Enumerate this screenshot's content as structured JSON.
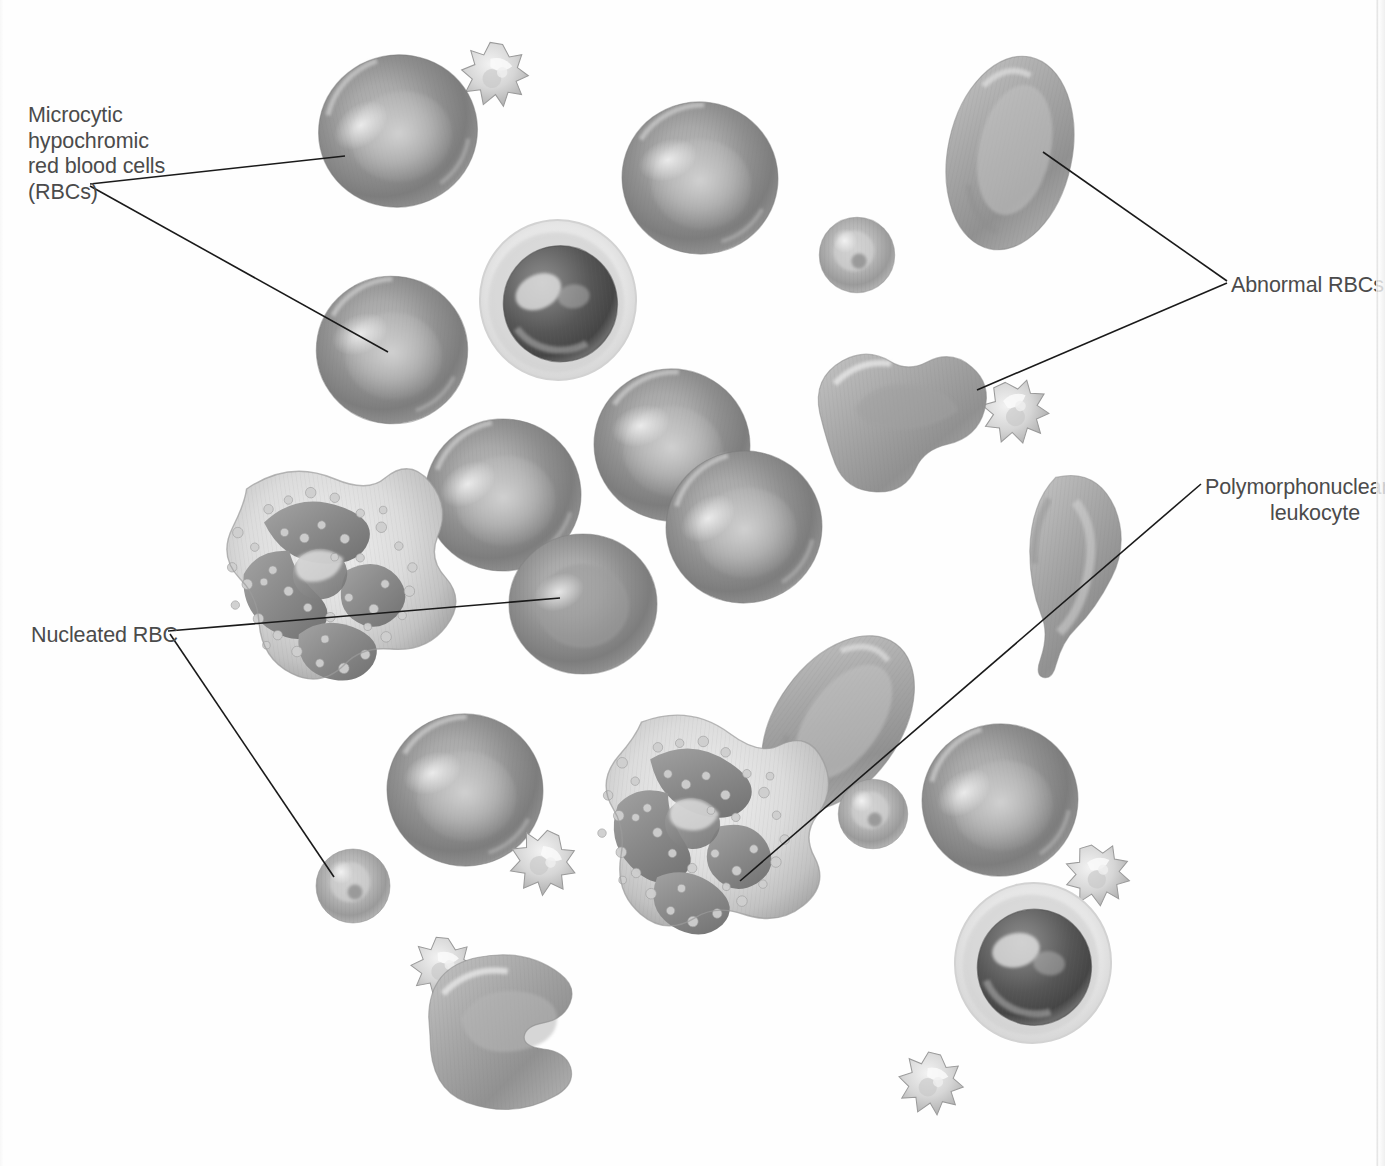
{
  "figure": {
    "kind": "medical-illustration",
    "background_color": "#fefefe",
    "label_color": "#4b4b4b",
    "leader_line_color": "#1a1a1a"
  },
  "labels": [
    {
      "id": "microcytic-hypochromic",
      "text": "Microcytic\nhypochromic\nred blood cells\n(RBCs)",
      "x": 28,
      "y": 103,
      "align": "left"
    },
    {
      "id": "abnormal-rbcs",
      "text": "Abnormal RBCs",
      "x": 1231,
      "y": 273,
      "align": "left"
    },
    {
      "id": "polymorphonuclear-leukocyte",
      "text": "Polymorphonuclear\nleukocyte",
      "x": 1205,
      "y": 475,
      "align": "right"
    },
    {
      "id": "nucleated-rbc",
      "text": "Nucleated RBC",
      "x": 31,
      "y": 623,
      "align": "left"
    }
  ],
  "leader_lines": [
    {
      "id": "microcytic-to-top-rbc",
      "x1": 90,
      "y1": 184,
      "x2": 345,
      "y2": 156
    },
    {
      "id": "microcytic-to-mid-rbc",
      "x1": 90,
      "y1": 186,
      "x2": 388,
      "y2": 352
    },
    {
      "id": "abnormal-to-oval-rbc",
      "x1": 1227,
      "y1": 281,
      "x2": 1043,
      "y2": 152
    },
    {
      "id": "abnormal-to-lobed-rbc",
      "x1": 1227,
      "y1": 283,
      "x2": 977,
      "y2": 390
    },
    {
      "id": "pmn-to-lower-neutrophil",
      "x1": 1201,
      "y1": 484,
      "x2": 740,
      "y2": 881
    },
    {
      "id": "nucleated-to-upper-rbc",
      "x1": 168,
      "y1": 631,
      "x2": 560,
      "y2": 598
    },
    {
      "id": "nucleated-to-small-rbc",
      "x1": 170,
      "y1": 634,
      "x2": 334,
      "y2": 877
    }
  ],
  "cells": [
    {
      "id": "rbc-top-left",
      "type": "microcytic-hypochromic-rbc",
      "cx": 398,
      "cy": 131,
      "rx": 80,
      "ry": 78,
      "rotate": -12
    },
    {
      "id": "platelet-top-left",
      "type": "platelet",
      "cx": 495,
      "cy": 75,
      "rx": 34,
      "ry": 34,
      "rotate": 14
    },
    {
      "id": "rbc-top-center",
      "type": "microcytic-hypochromic-rbc",
      "cx": 700,
      "cy": 178,
      "rx": 78,
      "ry": 77,
      "rotate": 8
    },
    {
      "id": "rbc-mid-left",
      "type": "microcytic-hypochromic-rbc",
      "cx": 392,
      "cy": 350,
      "rx": 76,
      "ry": 73,
      "rotate": 5
    },
    {
      "id": "nucleated-rbc-upper",
      "type": "nucleated-rbc",
      "cx": 558,
      "cy": 300,
      "rx": 79,
      "ry": 82,
      "rotate": -6
    },
    {
      "id": "microcyte-upper",
      "type": "microcyte",
      "cx": 857,
      "cy": 255,
      "rx": 38,
      "ry": 38,
      "rotate": 0
    },
    {
      "id": "ovalocyte-top-right",
      "type": "abnormal-rbc-ovalocyte",
      "cx": 1010,
      "cy": 153,
      "rx": 62,
      "ry": 98,
      "rotate": 12
    },
    {
      "id": "poikilocyte-right",
      "type": "abnormal-rbc-lobed",
      "cx": 910,
      "cy": 410,
      "rx": 92,
      "ry": 70,
      "rotate": -6
    },
    {
      "id": "platelet-right-mid",
      "type": "platelet",
      "cx": 1016,
      "cy": 412,
      "rx": 33,
      "ry": 33,
      "rotate": -20
    },
    {
      "id": "rbc-center-upper",
      "type": "microcytic-hypochromic-rbc",
      "cx": 503,
      "cy": 495,
      "rx": 78,
      "ry": 75,
      "rotate": -4
    },
    {
      "id": "rbc-center-pair-a",
      "type": "microcytic-hypochromic-rbc",
      "cx": 672,
      "cy": 445,
      "rx": 79,
      "ry": 76,
      "rotate": 10
    },
    {
      "id": "rbc-center-pair-b",
      "type": "microcytic-hypochromic-rbc",
      "cx": 744,
      "cy": 527,
      "rx": 79,
      "ry": 76,
      "rotate": -8
    },
    {
      "id": "neutrophil-left",
      "type": "polymorphonuclear-leukocyte",
      "cx": 323,
      "cy": 580,
      "rx": 108,
      "ry": 118,
      "rotate": -8
    },
    {
      "id": "rbc-nucleated-mid",
      "type": "nucleated-rbc-pale",
      "cx": 583,
      "cy": 604,
      "rx": 74,
      "ry": 70,
      "rotate": 0
    },
    {
      "id": "rbc-lower-left",
      "type": "microcytic-hypochromic-rbc",
      "cx": 465,
      "cy": 790,
      "rx": 78,
      "ry": 74,
      "rotate": 6
    },
    {
      "id": "platelet-lower-mid",
      "type": "platelet",
      "cx": 543,
      "cy": 863,
      "rx": 33,
      "ry": 31,
      "rotate": 30
    },
    {
      "id": "microcyte-nucleated",
      "type": "microcyte",
      "cx": 353,
      "cy": 886,
      "rx": 37,
      "ry": 37,
      "rotate": 0
    },
    {
      "id": "neutrophil-center",
      "type": "polymorphonuclear-leukocyte",
      "cx": 694,
      "cy": 830,
      "rx": 110,
      "ry": 120,
      "rotate": 6
    },
    {
      "id": "ovalocyte-center",
      "type": "abnormal-rbc-ovalocyte",
      "cx": 838,
      "cy": 723,
      "rx": 62,
      "ry": 96,
      "rotate": 36
    },
    {
      "id": "teardrop-right",
      "type": "abnormal-rbc-teardrop",
      "cx": 1075,
      "cy": 580,
      "rx": 58,
      "ry": 104,
      "rotate": 6
    },
    {
      "id": "microcyte-right-low",
      "type": "microcyte",
      "cx": 873,
      "cy": 814,
      "rx": 34,
      "ry": 34,
      "rotate": 0
    },
    {
      "id": "rbc-right-low",
      "type": "microcytic-hypochromic-rbc",
      "cx": 1000,
      "cy": 800,
      "rx": 80,
      "ry": 77,
      "rotate": -10
    },
    {
      "id": "platelet-right-low",
      "type": "platelet",
      "cx": 1098,
      "cy": 875,
      "rx": 33,
      "ry": 31,
      "rotate": -12
    },
    {
      "id": "nucleated-rbc-lower",
      "type": "nucleated-rbc",
      "cx": 1033,
      "cy": 963,
      "rx": 78,
      "ry": 80,
      "rotate": 8
    },
    {
      "id": "platelet-bottom",
      "type": "platelet",
      "cx": 931,
      "cy": 1084,
      "rx": 33,
      "ry": 33,
      "rotate": 18
    },
    {
      "id": "bite-cell-bottom",
      "type": "abnormal-rbc-bite-cell",
      "cx": 528,
      "cy": 1032,
      "rx": 100,
      "ry": 80,
      "rotate": -4
    },
    {
      "id": "platelet-bite-cell",
      "type": "platelet",
      "cx": 443,
      "cy": 968,
      "rx": 31,
      "ry": 30,
      "rotate": 10
    }
  ]
}
